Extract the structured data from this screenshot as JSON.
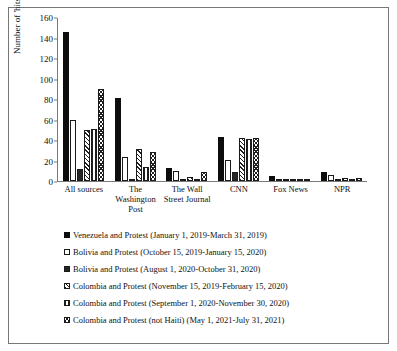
{
  "chart_data": {
    "type": "bar",
    "title": "",
    "xlabel": "",
    "ylabel": "Number of 'hits'",
    "ylim": [
      0,
      160
    ],
    "yticks": [
      0,
      20,
      40,
      60,
      80,
      100,
      120,
      140,
      160
    ],
    "grid": false,
    "legend_position": "below",
    "categories": [
      "All sources",
      "The Washington Post",
      "The Wall Street Journal",
      "CNN",
      "Fox News",
      "NPR"
    ],
    "series": [
      {
        "name": "Venezuela and Protest (January 1, 2019-March 31, 2019)",
        "pattern": "solid-black",
        "values": [
          146,
          81,
          13,
          43,
          5,
          9
        ]
      },
      {
        "name": "Bolivia and Protest (October 15, 2019-January 15, 2020)",
        "pattern": "white-dotted",
        "values": [
          60,
          24,
          10,
          21,
          2,
          6
        ]
      },
      {
        "name": "Bolivia and Protest (August 1, 2020-October 31, 2020)",
        "pattern": "grey-dotted",
        "values": [
          12,
          2,
          0,
          9,
          0,
          0
        ]
      },
      {
        "name": "Colombia and Protest (November 15, 2019-February 15, 2020)",
        "pattern": "diagonal-hatch",
        "values": [
          50,
          31,
          4,
          42,
          1,
          3
        ]
      },
      {
        "name": "Colombia and Protest (September 1, 2020-November 30, 2020)",
        "pattern": "vertical-hatch",
        "values": [
          51,
          14,
          2,
          41,
          1,
          2
        ]
      },
      {
        "name": "Colombia and Protest (not Haiti) (May 1, 2021-July 31, 2021)",
        "pattern": "cross-hatch",
        "values": [
          90,
          28,
          9,
          42,
          1,
          3
        ]
      }
    ]
  }
}
